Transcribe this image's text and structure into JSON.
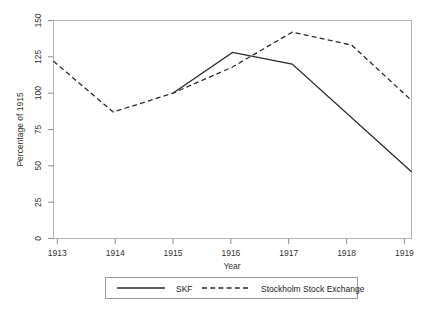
{
  "chart_data": {
    "type": "line",
    "title": "",
    "xlabel": "Year",
    "ylabel": "Percentage of 1915",
    "x": [
      1913,
      1914,
      1915,
      1916,
      1917,
      1918,
      1919
    ],
    "xtick_labels": [
      "1913",
      "1914",
      "1915",
      "1916",
      "1917",
      "1918",
      "1919"
    ],
    "xlim": [
      1913,
      1919
    ],
    "ylim": [
      0,
      150
    ],
    "ytick_labels": [
      "0",
      "25",
      "50",
      "75",
      "100",
      "125",
      "150"
    ],
    "yticks": [
      0,
      25,
      50,
      75,
      100,
      125,
      150
    ],
    "grid": false,
    "legend_position": "below",
    "series": [
      {
        "name": "SKF",
        "style": "solid",
        "color": "#2b2b2b",
        "x": [
          1915,
          1916,
          1917,
          1919
        ],
        "values": [
          100,
          128,
          120,
          46
        ]
      },
      {
        "name": "Stockholm Stock Exchange",
        "style": "dashed",
        "color": "#2b2b2b",
        "x": [
          1913,
          1914,
          1915,
          1916,
          1917,
          1918,
          1919
        ],
        "values": [
          122,
          87,
          100,
          118,
          142,
          133,
          95
        ]
      }
    ]
  },
  "legend": {
    "entries": [
      {
        "label": "SKF",
        "style": "solid"
      },
      {
        "label": "Stockholm Stock Exchange",
        "style": "dashed"
      }
    ]
  }
}
